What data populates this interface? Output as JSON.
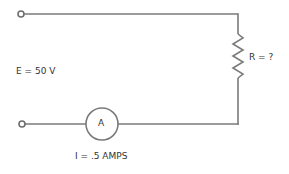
{
  "diagram": {
    "type": "series-circuit",
    "colors": {
      "wire": "#7a7a7a",
      "text": "#333333",
      "background": "#ffffff"
    },
    "source": {
      "label": "E = 50 V",
      "voltage": "50 V"
    },
    "resistor": {
      "label": "R = ?",
      "value": "?"
    },
    "ammeter": {
      "symbol": "A",
      "label": "I = .5 AMPS",
      "current": ".5 AMPS"
    },
    "terminals": [
      "top-left-terminal",
      "bottom-left-terminal"
    ]
  }
}
